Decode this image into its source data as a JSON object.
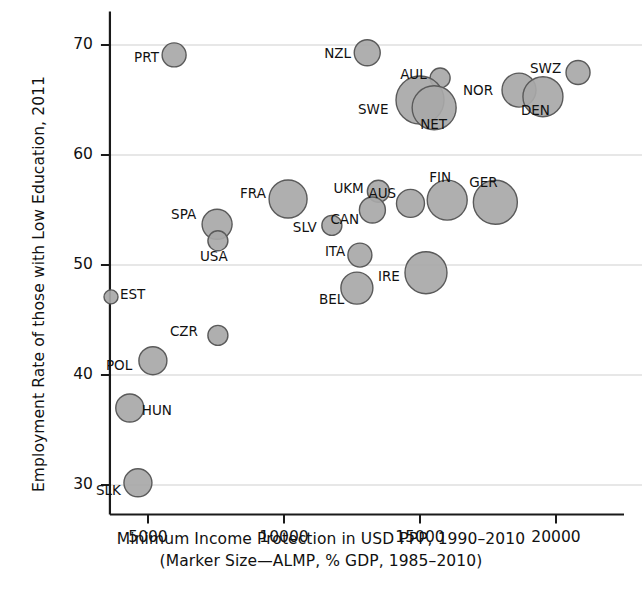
{
  "chart_data": {
    "type": "scatter",
    "variant": "bubble",
    "title": "",
    "xlabel": "Minimum Income Protection in USD PPP, 1990–2010",
    "xlabel_line2": "(Marker Size—ALMP, % GDP, 1985–2010)",
    "ylabel": "Employment Rate of those with Low Education, 2011",
    "xlim": [
      3600,
      21200
    ],
    "ylim": [
      28.5,
      71.5
    ],
    "xticks": [
      5000,
      10000,
      15000,
      20000
    ],
    "xtick_labels": [
      "5000",
      "10000",
      "15000",
      "20000"
    ],
    "yticks": [
      30,
      40,
      50,
      60,
      70
    ],
    "ytick_labels": [
      "30",
      "40",
      "50",
      "60",
      "70"
    ],
    "grid": "horizontal",
    "legend": "none",
    "marker_fill": "#a8a8a8",
    "marker_stroke": "#5a5a5a",
    "points": [
      {
        "label": "PRT",
        "x": 5960,
        "y": 69.1,
        "r": 12,
        "label_dx": -40,
        "label_dy": 3
      },
      {
        "label": "NZL",
        "x": 13060,
        "y": 69.3,
        "r": 13,
        "label_dx": -43,
        "label_dy": 1
      },
      {
        "label": "SWZ",
        "x": 20810,
        "y": 67.5,
        "r": 12,
        "label_dx": -48,
        "label_dy": -4
      },
      {
        "label": "AUL",
        "x": 15740,
        "y": 67.0,
        "r": 10,
        "label_dx": -40,
        "label_dy": -3
      },
      {
        "label": "NOR",
        "x": 18640,
        "y": 65.9,
        "r": 17,
        "label_dx": -56,
        "label_dy": 1
      },
      {
        "label": "SWE",
        "x": 15000,
        "y": 65.0,
        "r": 24,
        "label_dx": -62,
        "label_dy": 10
      },
      {
        "label": "DEN",
        "x": 19520,
        "y": 65.3,
        "r": 20,
        "label_dx": -22,
        "label_dy": 14
      },
      {
        "label": "NET",
        "x": 15520,
        "y": 64.3,
        "r": 22,
        "label_dx": -14,
        "label_dy": 17
      },
      {
        "label": "FIN",
        "x": 16000,
        "y": 55.9,
        "r": 20,
        "label_dx": -18,
        "label_dy": -22
      },
      {
        "label": "GER",
        "x": 17770,
        "y": 55.7,
        "r": 22,
        "label_dx": -26,
        "label_dy": -19
      },
      {
        "label": "AUS",
        "x": 14650,
        "y": 55.6,
        "r": 14,
        "label_dx": -42,
        "label_dy": -9
      },
      {
        "label": "UKM",
        "x": 13470,
        "y": 56.7,
        "r": 11,
        "label_dx": -45,
        "label_dy": -2
      },
      {
        "label": "FRA",
        "x": 10150,
        "y": 56.0,
        "r": 19,
        "label_dx": -48,
        "label_dy": -5
      },
      {
        "label": "CAN",
        "x": 13250,
        "y": 55.0,
        "r": 13,
        "label_dx": -42,
        "label_dy": 10
      },
      {
        "label": "SPA",
        "x": 7540,
        "y": 53.7,
        "r": 15,
        "label_dx": -46,
        "label_dy": -9
      },
      {
        "label": "SLV",
        "x": 11760,
        "y": 53.6,
        "r": 10,
        "label_dx": -39,
        "label_dy": 3
      },
      {
        "label": "USA",
        "x": 7570,
        "y": 52.2,
        "r": 10,
        "label_dx": -18,
        "label_dy": 16
      },
      {
        "label": "ITA",
        "x": 12790,
        "y": 50.9,
        "r": 12,
        "label_dx": -35,
        "label_dy": -3
      },
      {
        "label": "IRE",
        "x": 15220,
        "y": 49.3,
        "r": 21,
        "label_dx": -48,
        "label_dy": 4
      },
      {
        "label": "BEL",
        "x": 12680,
        "y": 47.9,
        "r": 16,
        "label_dx": -38,
        "label_dy": 12
      },
      {
        "label": "EST",
        "x": 3640,
        "y": 47.1,
        "r": 7,
        "label_dx": 9,
        "label_dy": -2
      },
      {
        "label": "CZR",
        "x": 7570,
        "y": 43.6,
        "r": 10,
        "label_dx": -48,
        "label_dy": -3
      },
      {
        "label": "POL",
        "x": 5180,
        "y": 41.3,
        "r": 14,
        "label_dx": -47,
        "label_dy": 5
      },
      {
        "label": "HUN",
        "x": 4330,
        "y": 37.0,
        "r": 14,
        "label_dx": 12,
        "label_dy": 3
      },
      {
        "label": "SLK",
        "x": 4630,
        "y": 30.2,
        "r": 14,
        "label_dx": -42,
        "label_dy": 8
      }
    ]
  }
}
